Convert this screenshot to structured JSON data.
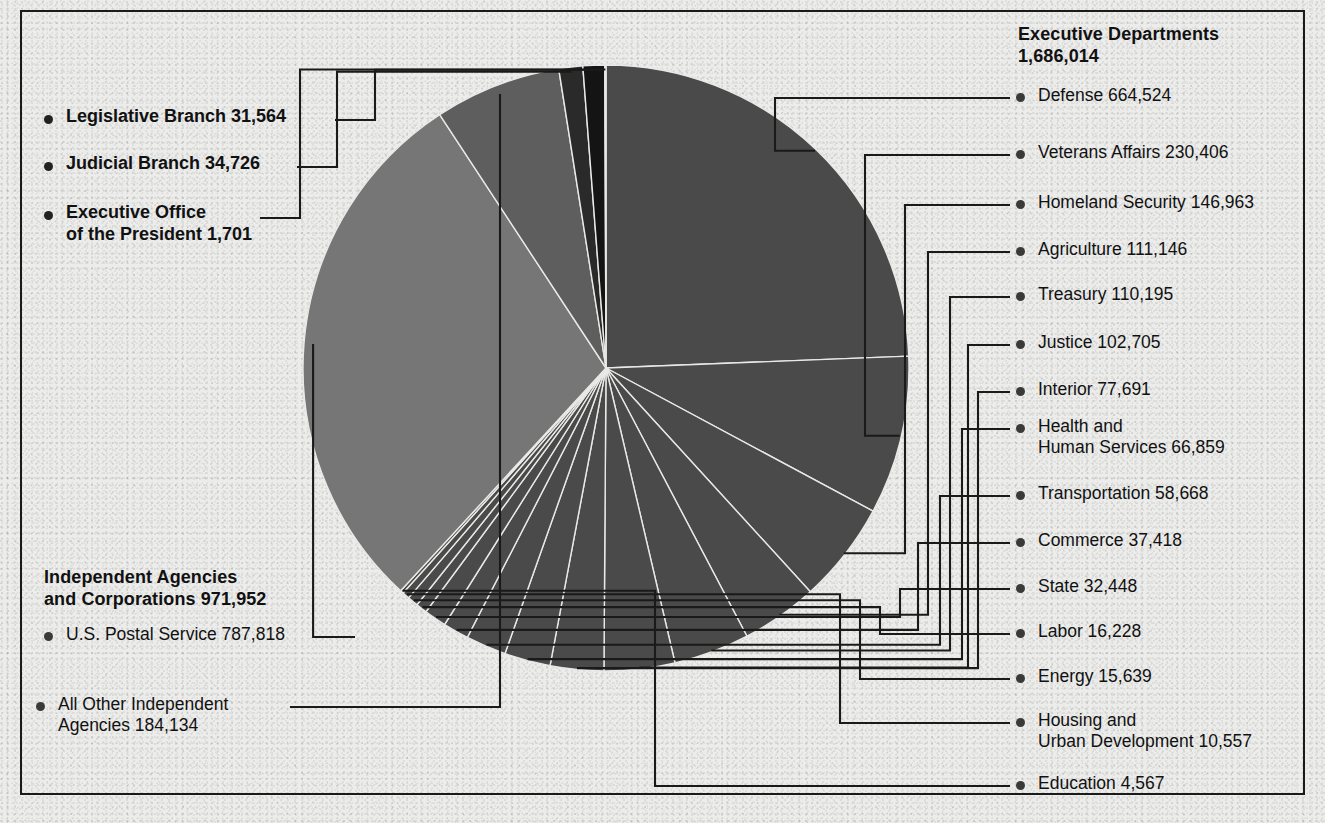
{
  "chart_data": {
    "type": "pie",
    "title": "",
    "units": "employees",
    "total": 2725957,
    "legend_position": "callout-labels",
    "center": {
      "x": 606,
      "y": 368
    },
    "radius": 303,
    "start_angle_deg": -90,
    "categories": [
      "Defense",
      "Veterans Affairs",
      "Homeland Security",
      "Agriculture",
      "Treasury",
      "Justice",
      "Interior",
      "Health and Human Services",
      "Transportation",
      "Commerce",
      "State",
      "Labor",
      "Energy",
      "Housing and Urban Development",
      "Education",
      "U.S. Postal Service",
      "All Other Independent Agencies",
      "Judicial Branch",
      "Legislative Branch",
      "Executive Office of the President"
    ],
    "values": [
      664524,
      230406,
      146963,
      111146,
      110195,
      102705,
      77691,
      66859,
      58668,
      37418,
      32448,
      16228,
      15639,
      10557,
      4567,
      787818,
      184134,
      34726,
      31564,
      1701
    ],
    "colors": [
      "#4a4a4a",
      "#4a4a4a",
      "#4a4a4a",
      "#4a4a4a",
      "#4a4a4a",
      "#4a4a4a",
      "#4a4a4a",
      "#4a4a4a",
      "#4a4a4a",
      "#4a4a4a",
      "#4a4a4a",
      "#4a4a4a",
      "#4a4a4a",
      "#4a4a4a",
      "#4a4a4a",
      "#767676",
      "#5e5e5e",
      "#2a2a2a",
      "#141414",
      "#303030"
    ]
  },
  "groups": {
    "executive_departments": {
      "title_line1": "Executive Departments",
      "title_line2": "1,686,014",
      "items": [
        {
          "label": "Defense  664,524"
        },
        {
          "label": "Veterans Affairs  230,406"
        },
        {
          "label": "Homeland Security  146,963"
        },
        {
          "label": "Agriculture  111,146"
        },
        {
          "label": "Treasury  110,195"
        },
        {
          "label": "Justice  102,705"
        },
        {
          "label": "Interior  77,691"
        },
        {
          "label_line1": "Health and",
          "label_line2": "Human Services  66,859"
        },
        {
          "label": "Transportation  58,668"
        },
        {
          "label": "Commerce  37,418"
        },
        {
          "label": "State  32,448"
        },
        {
          "label": "Labor  16,228"
        },
        {
          "label": "Energy  15,639"
        },
        {
          "label_line1": "Housing and",
          "label_line2": "Urban Development  10,557"
        },
        {
          "label": "Education  4,567"
        }
      ]
    },
    "independent_agencies": {
      "title_line1": "Independent Agencies",
      "title_line2": "and Corporations 971,952",
      "items": [
        {
          "label": "U.S. Postal Service  787,818"
        },
        {
          "label_line1": "All Other Independent",
          "label_line2": "Agencies  184,134"
        }
      ]
    },
    "branches": {
      "items": [
        {
          "label": "Legislative Branch  31,564"
        },
        {
          "label": "Judicial Branch  34,726"
        },
        {
          "label_line1": "Executive Office",
          "label_line2": "of the President  1,701"
        }
      ]
    }
  }
}
